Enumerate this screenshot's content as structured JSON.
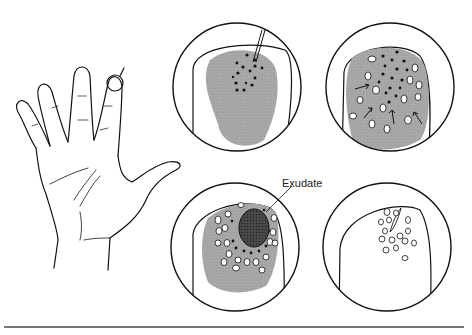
{
  "figure": {
    "labels": {
      "exudate": "Exudate"
    },
    "panels": [
      {
        "id": "hand",
        "description": "palm of hand with fingertip circled"
      },
      {
        "id": "stage-1",
        "description": "fingertip with puncture and black dots"
      },
      {
        "id": "stage-2",
        "description": "dots spreading with white cells and arrows"
      },
      {
        "id": "stage-3",
        "description": "central exudate surrounded by white cells"
      },
      {
        "id": "stage-4",
        "description": "healed fingertip with cell outlines"
      }
    ],
    "colors": {
      "shade": "#a8a8a8",
      "exudate": "#444444",
      "line": "#111111"
    }
  }
}
